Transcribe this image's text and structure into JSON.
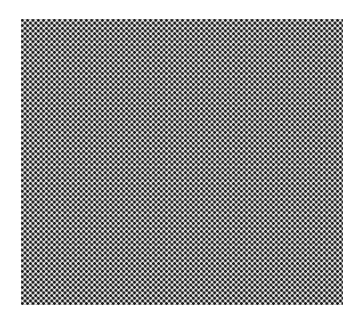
{
  "image": {
    "description": "Woven mesh / checker texture swatch on white background",
    "canvas_size": [
      363,
      321
    ],
    "swatch": {
      "x": 21,
      "y": 19,
      "width": 322,
      "height": 286,
      "pattern_period_px": 5.35
    },
    "colors": {
      "background": "#ffffff",
      "base_gray": "#5a5a5a",
      "dark_dot": "#0e0e0e",
      "light_dot": "#f4f4f4"
    }
  }
}
